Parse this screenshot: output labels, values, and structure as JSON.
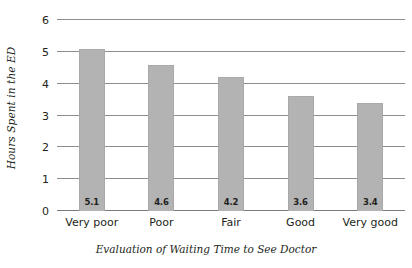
{
  "chart_data": {
    "type": "bar",
    "title": "",
    "categories": [
      "Very poor",
      "Poor",
      "Fair",
      "Good",
      "Very good"
    ],
    "values": [
      5.1,
      4.6,
      4.2,
      3.6,
      3.4
    ],
    "value_labels": [
      "5.1",
      "4.6",
      "4.2",
      "3.6",
      "3.4"
    ],
    "xlabel": "Evaluation of Waiting Time to See Doctor",
    "ylabel": "Hours Spent in the ED",
    "ylim": [
      0,
      6
    ],
    "yticks": [
      0,
      1,
      2,
      3,
      4,
      5,
      6
    ],
    "ytick_labels": [
      "0",
      "1",
      "2",
      "3",
      "4",
      "5",
      "6"
    ],
    "grid": true,
    "grid_axis": "y",
    "legend": false,
    "bar_color": "#b3b3b3",
    "grid_color": "#8c8c8c",
    "text_color": "#231f20",
    "background": "#ffffff"
  }
}
